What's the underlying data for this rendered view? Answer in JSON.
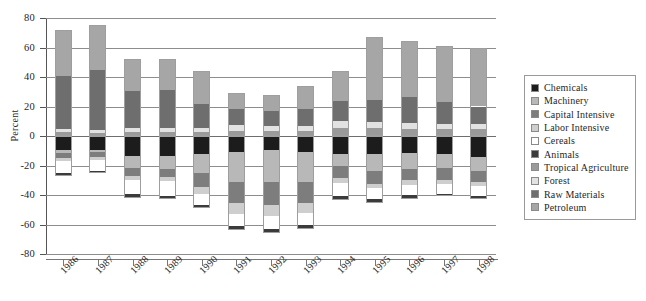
{
  "chart_data": {
    "type": "bar",
    "subtype": "stacked-bar-with-negatives",
    "title": "",
    "xlabel": "",
    "ylabel": "Percent",
    "ylim": [
      -80,
      80
    ],
    "yticks": [
      80,
      60,
      40,
      20,
      0,
      -20,
      -40,
      -60,
      -80
    ],
    "ytick_labels": [
      "80",
      "60",
      "40",
      "20",
      "0",
      "-20",
      "-40",
      "-60",
      "-80"
    ],
    "grid": true,
    "grid_axis": "y",
    "legend_position": "right",
    "categories": [
      "1986",
      "1987",
      "1988",
      "1989",
      "1990",
      "1991",
      "1992",
      "1993",
      "1994",
      "1995",
      "1996",
      "1997",
      "1998"
    ],
    "series": [
      {
        "name": "Chemicals",
        "color": "#1c1c1c",
        "values": [
          -9.5,
          -9.5,
          -13.5,
          -13.5,
          -12.0,
          -11.0,
          -9.5,
          -11.0,
          -12.5,
          -12.0,
          -11.5,
          -12.5,
          -14.0
        ]
      },
      {
        "name": "Machinery",
        "color": "#b8b8b8",
        "values": [
          -2.0,
          -1.5,
          -8.0,
          -9.0,
          -13.0,
          -20.5,
          -22.0,
          -20.0,
          -8.0,
          -12.0,
          -11.0,
          -9.5,
          -9.5
        ]
      },
      {
        "name": "Capital Intensive",
        "color": "#7d7d7d",
        "values": [
          -3.5,
          -3.0,
          -5.5,
          -5.5,
          -9.5,
          -14.0,
          -15.0,
          -14.5,
          -8.0,
          -8.5,
          -7.5,
          -7.5,
          -7.5
        ]
      },
      {
        "name": "Labor Intensive",
        "color": "#cecece",
        "values": [
          -2.0,
          -2.0,
          -2.5,
          -2.5,
          -4.5,
          -7.5,
          -8.0,
          -7.0,
          -3.5,
          -3.0,
          -3.0,
          -3.0,
          -3.0
        ]
      },
      {
        "name": "Cereals",
        "color": "#ffffff",
        "values": [
          -8.0,
          -7.5,
          -10.0,
          -10.0,
          -7.5,
          -8.0,
          -8.5,
          -7.5,
          -8.5,
          -7.5,
          -7.0,
          -6.5,
          -6.5
        ]
      },
      {
        "name": "Animals",
        "color": "#3b3b3b",
        "values": [
          -2.0,
          -1.5,
          -2.5,
          -2.5,
          -2.0,
          -3.0,
          -3.0,
          -3.0,
          -3.0,
          -2.5,
          -2.5,
          -2.0,
          -2.0
        ]
      },
      {
        "name": "Tropical Agriculture",
        "color": "#9a9a9a",
        "values": [
          2.5,
          2.0,
          3.0,
          3.0,
          3.0,
          3.5,
          3.5,
          3.5,
          5.5,
          5.5,
          5.0,
          4.5,
          4.5
        ]
      },
      {
        "name": "Forest",
        "color": "#e2e2e2",
        "values": [
          2.0,
          2.0,
          2.5,
          2.5,
          2.5,
          4.0,
          3.5,
          3.5,
          4.5,
          4.0,
          4.0,
          3.5,
          3.5
        ]
      },
      {
        "name": "Raw Materials",
        "color": "#6e6e6e",
        "values": [
          36.5,
          41.0,
          25.0,
          26.0,
          16.5,
          11.0,
          10.0,
          11.5,
          14.0,
          15.0,
          17.5,
          15.0,
          12.0
        ]
      },
      {
        "name": "Petroleum",
        "color": "#a6a6a6",
        "values": [
          31.0,
          30.5,
          21.5,
          21.0,
          22.0,
          10.5,
          10.5,
          15.5,
          20.0,
          42.5,
          38.0,
          38.0,
          39.5
        ]
      }
    ],
    "positive_totals": [
      72,
      75.5,
      52,
      52.5,
      44,
      29,
      27.5,
      34,
      44,
      67,
      64.5,
      61,
      59.5
    ],
    "negative_totals": [
      -27,
      -25,
      -42,
      -43,
      -48.5,
      -64,
      -66,
      -63,
      -43.5,
      -45.5,
      -42.5,
      -41,
      -42.5
    ]
  },
  "axis": {
    "y_title": "Percent"
  },
  "legend": {
    "items": [
      {
        "label": "Chemicals",
        "color": "#1c1c1c"
      },
      {
        "label": "Machinery",
        "color": "#b8b8b8"
      },
      {
        "label": "Capital Intensive",
        "color": "#7d7d7d"
      },
      {
        "label": "Labor Intensive",
        "color": "#cecece"
      },
      {
        "label": "Cereals",
        "color": "#ffffff"
      },
      {
        "label": "Animals",
        "color": "#3b3b3b"
      },
      {
        "label": "Tropical Agriculture",
        "color": "#9a9a9a"
      },
      {
        "label": "Forest",
        "color": "#e2e2e2"
      },
      {
        "label": "Raw Materials",
        "color": "#6e6e6e"
      },
      {
        "label": "Petroleum",
        "color": "#a6a6a6"
      }
    ]
  }
}
